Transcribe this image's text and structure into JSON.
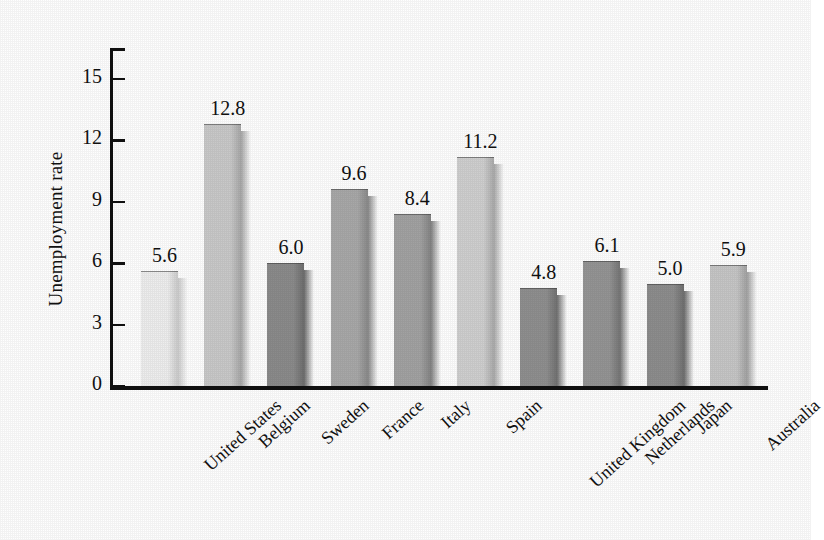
{
  "chart_data": {
    "type": "bar",
    "title": "",
    "xlabel": "",
    "ylabel": "Unemployment rate",
    "categories": [
      "United States",
      "Belgium",
      "Sweden",
      "France",
      "Italy",
      "Spain",
      "United Kingdom",
      "Netherlands",
      "Japan",
      "Australia"
    ],
    "values": [
      5.6,
      12.8,
      6.0,
      9.6,
      8.4,
      11.2,
      4.8,
      6.1,
      5.0,
      5.9
    ],
    "value_labels": [
      "5.6",
      "12.8",
      "6.0",
      "9.6",
      "8.4",
      "11.2",
      "4.8",
      "6.1",
      "5.0",
      "5.9"
    ],
    "bar_colors": [
      "#eeeeee",
      "#c9c9c9",
      "#8b8b8b",
      "#a8a8a8",
      "#a2a2a2",
      "#cfcfcf",
      "#8f8f8f",
      "#949494",
      "#8d8d8d",
      "#c6c6c6"
    ],
    "bar_side_colors": [
      "#cccccc",
      "#a8a8a8",
      "#6e6e6e",
      "#8a8a8a",
      "#848484",
      "#ababab",
      "#727272",
      "#767676",
      "#707070",
      "#a3a3a3"
    ],
    "ylim": [
      0,
      16.5
    ],
    "yticks": [
      0,
      3,
      6,
      9,
      12,
      15
    ],
    "ytick_labels": [
      "0",
      "3",
      "6",
      "9",
      "12",
      "15"
    ],
    "grid": false,
    "legend": false,
    "legend_position": "none",
    "xtick_label_rotation_deg": -42
  },
  "axes": {
    "y_title": "Unemployment rate"
  }
}
